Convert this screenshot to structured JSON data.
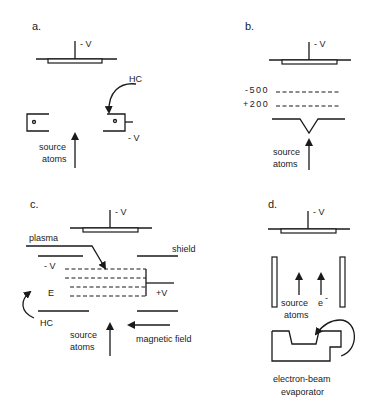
{
  "figure": {
    "panels": [
      {
        "id": "a",
        "label": "a.",
        "target_voltage": "- V",
        "hc_label": "HC",
        "ring_voltage": "- V",
        "source_line1": "source",
        "source_line2": "atoms"
      },
      {
        "id": "b",
        "label": "b.",
        "target_voltage": "- V",
        "grid_top": "-500",
        "grid_bottom": "+200",
        "source_line1": "source",
        "source_line2": "atoms"
      },
      {
        "id": "c",
        "label": "c.",
        "target_voltage": "- V",
        "plasma": "plasma",
        "shield": "shield",
        "neg_voltage": "- V",
        "e_label": "E",
        "pos_voltage": "+V",
        "hc_label": "HC",
        "source_line1": "source",
        "source_line2": "atoms",
        "magnetic_field": "magnetic field"
      },
      {
        "id": "d",
        "label": "d.",
        "target_voltage": "- V",
        "source_line1": "source",
        "source_line2": "atoms",
        "electron": "e",
        "electron_sup": "-",
        "evaporator_line1": "electron-beam",
        "evaporator_line2": "evaporator"
      }
    ]
  }
}
